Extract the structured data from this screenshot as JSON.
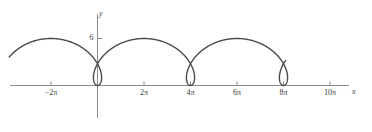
{
  "figure": {
    "background_color": "#ffffff",
    "curve_color": "#4a4a4a",
    "axis_color": "#8c8c8c",
    "text_color": "#3a3a3a",
    "width": 372,
    "height": 132
  },
  "axes": {
    "x_axis_label": "x",
    "y_axis_label": "y",
    "x_tick_labels": [
      {
        "label": "−2π",
        "value": -6.2832
      },
      {
        "label": "2π",
        "value": 6.2832
      },
      {
        "label": "4π",
        "value": 12.5664
      },
      {
        "label": "6π",
        "value": 18.8496
      },
      {
        "label": "8π",
        "value": 25.1327
      },
      {
        "label": "10π",
        "value": 31.4159
      }
    ],
    "y_tick_labels": [
      {
        "label": "6",
        "value": 6
      }
    ]
  },
  "chart_data": {
    "type": "line",
    "title": "",
    "xlabel": "x",
    "ylabel": "y",
    "xlim": [
      -9.42,
      34.5
    ],
    "ylim": [
      -2.2,
      7.2
    ],
    "grid": false,
    "legend": null,
    "curve_description": "prolate trochoid with loops, period 4π",
    "parametric": {
      "x_expression": "2t - 3 sin(t)",
      "y_expression": "3 - 3 cos(t)",
      "t_range": [
        -4.5,
        14.2
      ],
      "samples": 900
    },
    "features": {
      "loop_centers_x": [
        0,
        12.5664,
        25.1327
      ],
      "arch_peak_x": [
        -6.2832,
        6.2832,
        18.8496,
        31.4159
      ],
      "arch_peak_y": 6,
      "loop_min_y": -1.6,
      "self_intersection_y": 1.85
    },
    "annotations": []
  }
}
